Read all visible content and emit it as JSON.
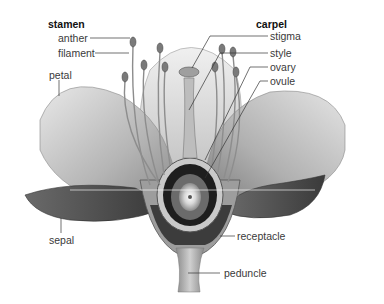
{
  "diagram": {
    "groups": [
      {
        "heading": "stamen",
        "parts": [
          "anther",
          "filament"
        ]
      },
      {
        "heading": "carpel",
        "parts": [
          "stigma",
          "style",
          "ovary",
          "ovule"
        ]
      }
    ],
    "labels": {
      "stamen": "stamen",
      "anther": "anther",
      "filament": "filament",
      "petal": "petal",
      "carpel": "carpel",
      "stigma": "stigma",
      "style": "style",
      "ovary": "ovary",
      "ovule": "ovule",
      "sepal": "sepal",
      "receptacle": "receptacle",
      "peduncle": "peduncle"
    },
    "colors": {
      "background": "#ffffff",
      "leader_line": "#333333",
      "label_text": "#3a3a3a",
      "heading_text": "#111111"
    }
  }
}
